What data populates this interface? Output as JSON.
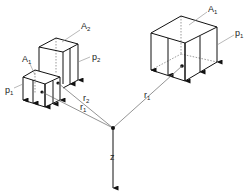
{
  "figure": {
    "type": "isometric load diagram",
    "labels": {
      "A1_right": {
        "main": "A",
        "sub": "1"
      },
      "p1_right": {
        "main": "p",
        "sub": "1"
      },
      "A2": {
        "main": "A",
        "sub": "2"
      },
      "p2": {
        "main": "p",
        "sub": "2"
      },
      "A1_left": {
        "main": "A",
        "sub": "1"
      },
      "p1_left": {
        "main": "p",
        "sub": "1"
      },
      "r1_left": {
        "main": "r",
        "sub": "1"
      },
      "r2": {
        "main": "r",
        "sub": "2"
      },
      "r1_right": {
        "main": "r",
        "sub": "1"
      },
      "z": "z"
    },
    "colors": {
      "line": "#111111",
      "leader": "#888888",
      "background": "#ffffff"
    }
  }
}
